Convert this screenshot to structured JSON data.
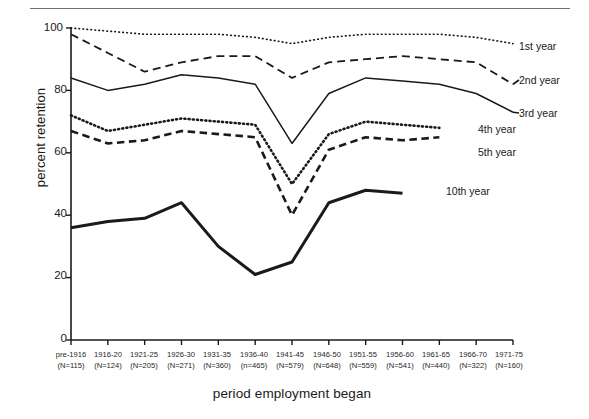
{
  "chart_data": {
    "type": "line",
    "title": "",
    "xlabel": "period employment began",
    "ylabel": "percent retention",
    "ylim": [
      0,
      100
    ],
    "yticks": [
      0,
      20,
      40,
      60,
      80,
      100
    ],
    "ytick_labels": [
      "0",
      "20",
      "40",
      "60",
      "80",
      "100"
    ],
    "grid": false,
    "legend_position": "right-inline-labels",
    "categories": [
      "pre-1916",
      "1916-20",
      "1921-25",
      "1926-30",
      "1931-35",
      "1936-40",
      "1941-45",
      "1946-50",
      "1951-55",
      "1956-60",
      "1961-65",
      "1966-70",
      "1971-75"
    ],
    "category_counts": [
      "(N=115)",
      "(N=124)",
      "(N=205)",
      "(N=271)",
      "(N=360)",
      "(n=465)",
      "(N=579)",
      "(N=648)",
      "(N=559)",
      "(N=541)",
      "(N=440)",
      "(N=322)",
      "(N=160)"
    ],
    "series": [
      {
        "name": "1st year",
        "style": "dotted-fine",
        "values": [
          100,
          99,
          98,
          98,
          98,
          97,
          95,
          97,
          98,
          98,
          98,
          97,
          95
        ]
      },
      {
        "name": "2nd year",
        "style": "dashed-long",
        "values": [
          98,
          92,
          86,
          89,
          91,
          91,
          84,
          89,
          90,
          91,
          90,
          89,
          82
        ]
      },
      {
        "name": "3rd year",
        "style": "solid-thin",
        "values": [
          84,
          80,
          82,
          85,
          84,
          82,
          63,
          79,
          84,
          83,
          82,
          79,
          73
        ]
      },
      {
        "name": "4th year",
        "style": "dotted-bold",
        "values": [
          72,
          67,
          69,
          71,
          70,
          69,
          50,
          66,
          70,
          69,
          68,
          null,
          null
        ]
      },
      {
        "name": "5th year",
        "style": "dashed-bold",
        "values": [
          67,
          63,
          64,
          67,
          66,
          65,
          40,
          61,
          65,
          64,
          65,
          null,
          null
        ]
      },
      {
        "name": "10th year",
        "style": "solid-bold",
        "values": [
          36,
          38,
          39,
          44,
          30,
          21,
          25,
          44,
          48,
          47,
          null,
          null,
          null
        ]
      }
    ]
  },
  "legend": {
    "items": [
      {
        "label": "1st year"
      },
      {
        "label": "2nd year"
      },
      {
        "label": "3rd year"
      },
      {
        "label": "4th year"
      },
      {
        "label": "5th year"
      },
      {
        "label": "10th year"
      }
    ]
  },
  "colors": {
    "ink": "#1a1a1a",
    "rule": "#6f6f6f",
    "background": "#ffffff"
  }
}
